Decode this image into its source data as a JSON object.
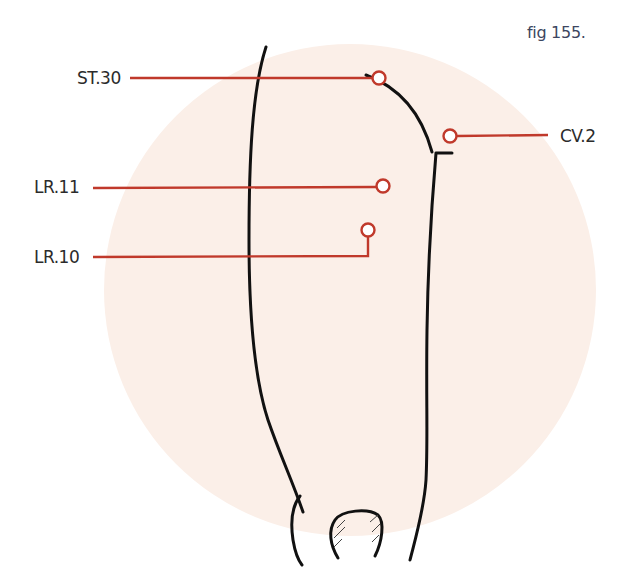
{
  "figure": {
    "caption": "fig 155.",
    "colors": {
      "background_disc": "#fbefe8",
      "leader_line": "#c0392b",
      "outline": "#111111",
      "caption_text": "#3c4660"
    },
    "points": [
      {
        "id": "st30",
        "label": "ST.30",
        "side": "left"
      },
      {
        "id": "lr11",
        "label": "LR.11",
        "side": "left"
      },
      {
        "id": "lr10",
        "label": "LR.10",
        "side": "left"
      },
      {
        "id": "cv2",
        "label": "CV.2",
        "side": "right"
      }
    ]
  }
}
